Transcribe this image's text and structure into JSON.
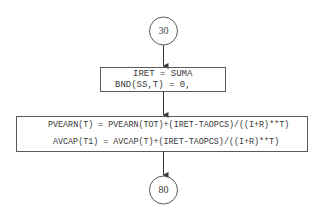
{
  "diagram": {
    "type": "flowchart",
    "colors": {
      "stroke": "#4a4a4a",
      "text": "#3a3a3a",
      "background": "#ffffff"
    },
    "nodes": [
      {
        "id": "c30",
        "shape": "circle-connector",
        "label": "30"
      },
      {
        "id": "p1",
        "shape": "process-box",
        "lines": [
          "IRET = SUMA",
          "BND(SS,T) = 0,"
        ]
      },
      {
        "id": "p2",
        "shape": "process-box",
        "lines": [
          "PVEARN(T) = PVEARN(TOT)+(IRET-TAOPCS)/((I+R)**T)",
          "AVCAP(T1) = AVCAP(T)+(IRET-TAOPCS)/((I+R)**T)"
        ]
      },
      {
        "id": "c80",
        "shape": "circle-connector",
        "label": "80"
      }
    ],
    "edges": [
      {
        "from": "c30",
        "to": "p1"
      },
      {
        "from": "p1",
        "to": "p2"
      },
      {
        "from": "p2",
        "to": "c80"
      }
    ]
  }
}
